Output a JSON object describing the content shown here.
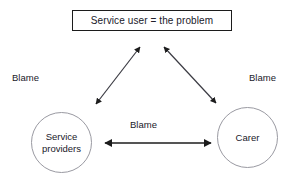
{
  "diagram": {
    "type": "triangle-blame-diagram",
    "background_color": "#ffffff",
    "nodes": {
      "top_box": {
        "label": "Service user = the problem",
        "shape": "rectangle",
        "border_color": "#1c1c1c"
      },
      "left_circle": {
        "label": "Service\nproviders",
        "shape": "circle",
        "border_color": "#9a9aa2"
      },
      "right_circle": {
        "label": "Carer",
        "shape": "circle",
        "border_color": "#9a9aa2"
      }
    },
    "edge_labels": {
      "left": "Blame",
      "right": "Blame",
      "center": "Blame"
    },
    "arrows": {
      "color": "#1c1c1c",
      "left_diagonal": "double-headed",
      "right_diagonal": "double-headed",
      "bottom_horizontal": "double-headed"
    }
  }
}
